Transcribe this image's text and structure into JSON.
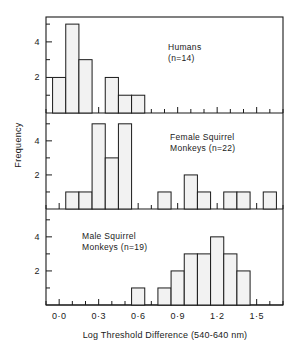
{
  "figure": {
    "xlabel": "Log Threshold Difference (540-640 nm)",
    "ylabel": "Frequency",
    "x_tick_labels": [
      "0·0",
      "0·3",
      "0·6",
      "0·9",
      "1·2",
      "1·5"
    ],
    "x_tick_values": [
      0.0,
      0.3,
      0.6,
      0.9,
      1.2,
      1.5
    ],
    "y_tick_labels": [
      "2",
      "4"
    ],
    "y_tick_values": [
      2,
      4
    ],
    "line_color": "#1a1a1a",
    "bar_fill": "#f2f2f2",
    "bar_stroke": "#1a1a1a",
    "background": "#ffffff"
  },
  "panels": [
    {
      "id": "humans",
      "caption": "Humans\n(n=14)",
      "caption_x": 168,
      "caption_y": 42
    },
    {
      "id": "female-squirrel-monkeys",
      "caption": "Female  Squirrel\nMonkeys (n=22)",
      "caption_x": 190,
      "caption_y": 133
    },
    {
      "id": "male-squirrel-monkeys",
      "caption": "Male  Squirrel\nMonkeys  (n=19)",
      "caption_x": 82,
      "caption_y": 232
    }
  ],
  "chart_data": {
    "type": "bar",
    "title": "",
    "xlabel": "Log Threshold Difference (540-640 nm)",
    "ylabel": "Frequency",
    "xlim": [
      -0.1,
      1.7
    ],
    "ylim": [
      0,
      5.4
    ],
    "bin_width": 0.1,
    "grid": false,
    "legend": "none",
    "panels": [
      {
        "name": "Humans (n=14)",
        "n": 14,
        "bins": [
          {
            "x0": -0.05,
            "x1": 0.05,
            "count": 2
          },
          {
            "x0": 0.05,
            "x1": 0.15,
            "count": 5
          },
          {
            "x0": 0.15,
            "x1": 0.25,
            "count": 3
          },
          {
            "x0": 0.35,
            "x1": 0.45,
            "count": 2
          },
          {
            "x0": 0.45,
            "x1": 0.55,
            "count": 1
          },
          {
            "x0": 0.55,
            "x1": 0.65,
            "count": 1
          }
        ]
      },
      {
        "name": "Female Squirrel Monkeys (n=22)",
        "n": 22,
        "bins": [
          {
            "x0": 0.05,
            "x1": 0.15,
            "count": 1
          },
          {
            "x0": 0.15,
            "x1": 0.25,
            "count": 1
          },
          {
            "x0": 0.25,
            "x1": 0.35,
            "count": 5
          },
          {
            "x0": 0.35,
            "x1": 0.45,
            "count": 3
          },
          {
            "x0": 0.45,
            "x1": 0.55,
            "count": 5
          },
          {
            "x0": 0.75,
            "x1": 0.85,
            "count": 1
          },
          {
            "x0": 0.95,
            "x1": 1.05,
            "count": 2
          },
          {
            "x0": 1.05,
            "x1": 1.15,
            "count": 1
          },
          {
            "x0": 1.25,
            "x1": 1.35,
            "count": 1
          },
          {
            "x0": 1.35,
            "x1": 1.45,
            "count": 1
          },
          {
            "x0": 1.55,
            "x1": 1.65,
            "count": 1
          }
        ]
      },
      {
        "name": "Male Squirrel Monkeys (n=19)",
        "n": 19,
        "bins": [
          {
            "x0": 0.55,
            "x1": 0.65,
            "count": 1
          },
          {
            "x0": 0.75,
            "x1": 0.85,
            "count": 1
          },
          {
            "x0": 0.85,
            "x1": 0.95,
            "count": 2
          },
          {
            "x0": 0.95,
            "x1": 1.05,
            "count": 3
          },
          {
            "x0": 1.05,
            "x1": 1.15,
            "count": 3
          },
          {
            "x0": 1.15,
            "x1": 1.25,
            "count": 4
          },
          {
            "x0": 1.25,
            "x1": 1.35,
            "count": 3
          },
          {
            "x0": 1.35,
            "x1": 1.45,
            "count": 2
          }
        ]
      }
    ]
  }
}
